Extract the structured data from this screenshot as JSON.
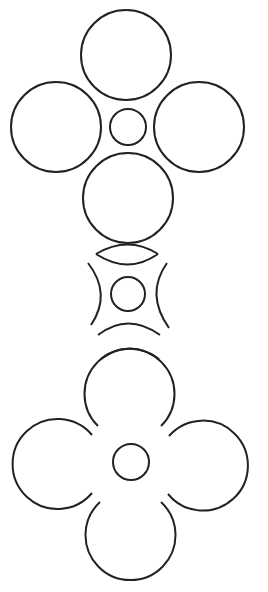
{
  "diagram": {
    "stroke_color": "#222222",
    "background": "#ffffff",
    "figures": [
      {
        "name": "four-circles-around-center",
        "center": [
          128,
          127
        ],
        "petal_radius": 45,
        "center_radius": 18
      },
      {
        "name": "concave-arcs-around-center",
        "center": [
          128,
          294
        ],
        "center_radius": 17
      },
      {
        "name": "four-petal-flower",
        "center": [
          130,
          462
        ],
        "petal_radius": 45,
        "center_radius": 18
      }
    ]
  }
}
